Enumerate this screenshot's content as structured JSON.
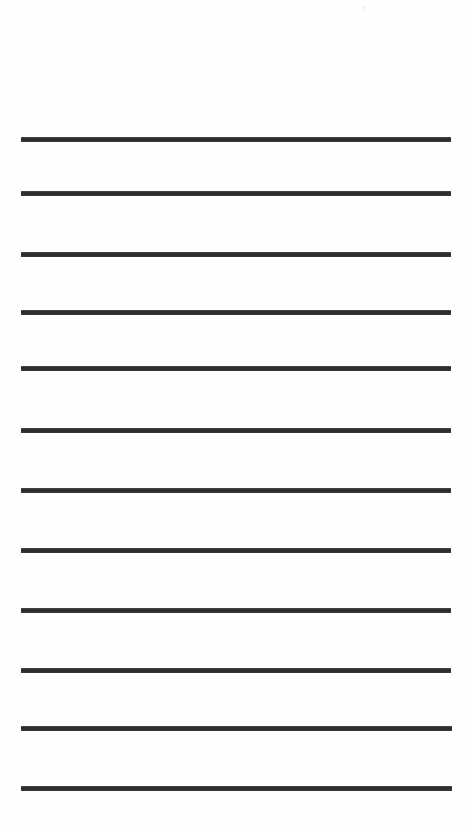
{
  "document": {
    "kind": "ruled-writing-paper",
    "title": "Blank Lined Paper Sheet",
    "page_width": 469,
    "page_height": 835,
    "background_color": "#fefefe",
    "orientation": "portrait",
    "body_text": "",
    "header_text": "",
    "footer_text": "",
    "page_number": ""
  },
  "rules": {
    "count": 12,
    "color": "#2e2e30",
    "thickness": 5,
    "left_x": 21,
    "right_x": 451,
    "length": 430,
    "spacing": 59,
    "first_line_y": 137,
    "lines": [
      {
        "index": 1,
        "y": 137,
        "x1": 21,
        "x2": 451,
        "thickness": 5
      },
      {
        "index": 2,
        "y": 191,
        "x1": 21,
        "x2": 451,
        "thickness": 5
      },
      {
        "index": 3,
        "y": 252,
        "x1": 21,
        "x2": 451,
        "thickness": 5
      },
      {
        "index": 4,
        "y": 310,
        "x1": 21,
        "x2": 451,
        "thickness": 5
      },
      {
        "index": 5,
        "y": 366,
        "x1": 21,
        "x2": 451,
        "thickness": 5
      },
      {
        "index": 6,
        "y": 428,
        "x1": 21,
        "x2": 451,
        "thickness": 5
      },
      {
        "index": 7,
        "y": 488,
        "x1": 21,
        "x2": 451,
        "thickness": 5
      },
      {
        "index": 8,
        "y": 548,
        "x1": 21,
        "x2": 451,
        "thickness": 5
      },
      {
        "index": 9,
        "y": 608,
        "x1": 21,
        "x2": 451,
        "thickness": 5
      },
      {
        "index": 10,
        "y": 668,
        "x1": 21,
        "x2": 451,
        "thickness": 5
      },
      {
        "index": 11,
        "y": 726,
        "x1": 21,
        "x2": 452,
        "thickness": 5
      },
      {
        "index": 12,
        "y": 786,
        "x1": 21,
        "x2": 452,
        "thickness": 5
      }
    ]
  },
  "artifacts": {
    "specks": [
      {
        "name": "top-right-speck",
        "x": 362,
        "y": 6,
        "size": 3,
        "color": "#ededed"
      }
    ]
  },
  "margins": {
    "top_margin_height": 137,
    "bottom_margin_height": 44,
    "left_margin_width": 21,
    "right_margin_width": 18
  }
}
